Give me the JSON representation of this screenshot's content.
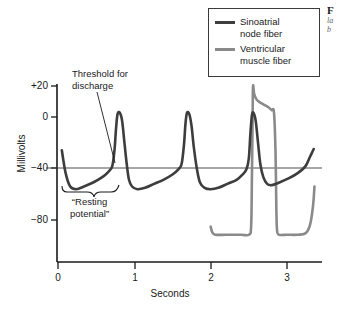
{
  "chart_data": {
    "type": "line",
    "title": "",
    "xlabel": "Seconds",
    "ylabel": "Millivolts",
    "xlim": [
      0,
      3.45
    ],
    "ylim": [
      -100,
      25
    ],
    "xticks": [
      0,
      1,
      2,
      3
    ],
    "xtick_labels": [
      "0",
      "1",
      "2",
      "3"
    ],
    "yticks": [
      20,
      0,
      -40,
      -80
    ],
    "ytick_labels": [
      "+20",
      "0",
      "−40",
      "−80"
    ],
    "grid": false,
    "legend_position": "top-right",
    "reference_lines": [
      {
        "name": "threshold-line",
        "axis": "y",
        "value": -40,
        "label": "Threshold for discharge"
      }
    ],
    "annotations": [
      {
        "name": "threshold-annotation",
        "text_line1": "Threshold for",
        "text_line2": "discharge",
        "points_to_x": 0.72,
        "points_to_y": -40
      },
      {
        "name": "resting-potential-annotation",
        "text_line1": "“Resting",
        "text_line2": "potential”",
        "spans_x": [
          0.1,
          0.68
        ],
        "value_y": -58
      }
    ],
    "series": [
      {
        "name": "Sinoatrial node fiber",
        "color": "#3d3d3d",
        "description": "Pacemaker potential: slow diastolic depolarization from about −55 mV up to threshold −40 mV, then action potential peaking near 0 mV, repeating about every 0.85 s",
        "resting_potential_mv": -55,
        "threshold_mv": -40,
        "peak_mv": 0,
        "peaks_at_seconds": [
          0.78,
          1.67,
          2.53
        ],
        "points": [
          [
            0.05,
            -28
          ],
          [
            0.1,
            -45
          ],
          [
            0.16,
            -55
          ],
          [
            0.24,
            -57
          ],
          [
            0.34,
            -55
          ],
          [
            0.46,
            -52
          ],
          [
            0.58,
            -48
          ],
          [
            0.66,
            -44
          ],
          [
            0.71,
            -40
          ],
          [
            0.74,
            -28
          ],
          [
            0.76,
            -12
          ],
          [
            0.78,
            -1
          ],
          [
            0.81,
            0
          ],
          [
            0.84,
            -6
          ],
          [
            0.87,
            -22
          ],
          [
            0.9,
            -38
          ],
          [
            0.93,
            -50
          ],
          [
            0.97,
            -55
          ],
          [
            1.04,
            -57
          ],
          [
            1.14,
            -56
          ],
          [
            1.26,
            -53
          ],
          [
            1.38,
            -50
          ],
          [
            1.5,
            -46
          ],
          [
            1.58,
            -42
          ],
          [
            1.62,
            -38
          ],
          [
            1.65,
            -24
          ],
          [
            1.67,
            -8
          ],
          [
            1.69,
            0
          ],
          [
            1.72,
            -1
          ],
          [
            1.75,
            -10
          ],
          [
            1.78,
            -26
          ],
          [
            1.82,
            -42
          ],
          [
            1.86,
            -52
          ],
          [
            1.92,
            -56
          ],
          [
            2.0,
            -57
          ],
          [
            2.1,
            -56
          ],
          [
            2.22,
            -53
          ],
          [
            2.34,
            -50
          ],
          [
            2.42,
            -46
          ],
          [
            2.47,
            -42
          ],
          [
            2.5,
            -34
          ],
          [
            2.52,
            -16
          ],
          [
            2.54,
            -2
          ],
          [
            2.56,
            0
          ],
          [
            2.59,
            -6
          ],
          [
            2.62,
            -22
          ],
          [
            2.65,
            -38
          ],
          [
            2.69,
            -48
          ],
          [
            2.74,
            -53
          ],
          [
            2.8,
            -54
          ],
          [
            2.9,
            -52
          ],
          [
            3.02,
            -49
          ],
          [
            3.14,
            -45
          ],
          [
            3.24,
            -40
          ],
          [
            3.3,
            -33
          ],
          [
            3.35,
            -27
          ]
        ]
      },
      {
        "name": "Ventricular muscle fiber",
        "color": "#8a8a8a",
        "description": "Stable resting potential near −90 mV, rapid upstroke to about +20 mV at 2.55 s, plateau phase, then rapid repolarization back to −90 mV at about 2.85 s",
        "resting_potential_mv": -90,
        "peak_mv": 20,
        "upstroke_at_seconds": 2.55,
        "repolarization_at_seconds": 2.85,
        "points": [
          [
            2.0,
            -85
          ],
          [
            2.02,
            -89
          ],
          [
            2.06,
            -91
          ],
          [
            2.2,
            -91
          ],
          [
            2.4,
            -91
          ],
          [
            2.5,
            -91
          ],
          [
            2.53,
            -85
          ],
          [
            2.54,
            -50
          ],
          [
            2.55,
            0
          ],
          [
            2.555,
            20
          ],
          [
            2.57,
            14
          ],
          [
            2.6,
            10
          ],
          [
            2.64,
            8
          ],
          [
            2.7,
            6
          ],
          [
            2.76,
            4
          ],
          [
            2.8,
            2
          ],
          [
            2.83,
            0
          ],
          [
            2.85,
            -30
          ],
          [
            2.86,
            -70
          ],
          [
            2.87,
            -88
          ],
          [
            2.9,
            -91
          ],
          [
            3.0,
            -91
          ],
          [
            3.14,
            -91
          ],
          [
            3.24,
            -90
          ],
          [
            3.3,
            -84
          ],
          [
            3.34,
            -70
          ],
          [
            3.36,
            -55
          ]
        ]
      }
    ]
  },
  "legend": {
    "items": [
      {
        "label_line1": "Sinoatrial",
        "label_line2": "node fiber",
        "color": "#3d3d3d"
      },
      {
        "label_line1": "Ventricular",
        "label_line2": "muscle fiber",
        "color": "#8a8a8a"
      }
    ]
  },
  "axes": {
    "y_title": "Millivolts",
    "x_title": "Seconds",
    "y_labels": [
      "+20",
      "0",
      "−40",
      "−80"
    ],
    "x_labels": [
      "0",
      "1",
      "2",
      "3"
    ]
  },
  "annotations": {
    "threshold_line1": "Threshold for",
    "threshold_line2": "discharge",
    "resting_line1": "“Resting",
    "resting_line2": "potential”"
  },
  "caption": {
    "head": "F",
    "line1": "la",
    "line2": "b"
  }
}
